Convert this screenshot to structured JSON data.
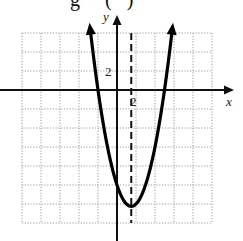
{
  "header": {
    "clipped_title_fragment": "g     (   )"
  },
  "chart_data": {
    "type": "line",
    "title": "",
    "xlabel": "x",
    "ylabel": "y",
    "grid": true,
    "grid_step_units": 2,
    "tick_labels": {
      "x": [
        "2"
      ],
      "y": [
        "2"
      ]
    },
    "xlim": [
      -10,
      10
    ],
    "ylim": [
      -14,
      6
    ],
    "function": "y = x^2 - 3x - 10",
    "series": [
      {
        "name": "parabola",
        "x": [
          -2.8,
          -2,
          -1,
          0,
          1,
          1.5,
          2,
          3,
          4,
          5,
          5.8
        ],
        "y": [
          6.24,
          0,
          -6,
          -10,
          -12,
          -12.25,
          -12,
          -10,
          -6,
          0,
          6.24
        ]
      }
    ],
    "annotations": {
      "vertex": [
        1.5,
        -12.25
      ],
      "x_intercepts": [
        -2,
        5
      ],
      "y_intercept": -10,
      "axis_of_symmetry": {
        "x": 1.5,
        "style": "dashed"
      },
      "arrows_on_ends": true
    }
  }
}
